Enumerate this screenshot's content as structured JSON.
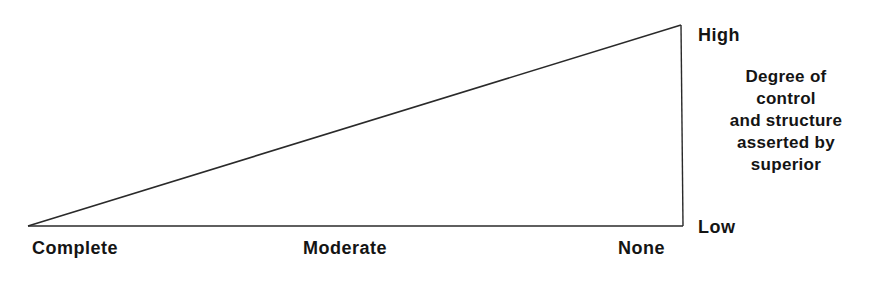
{
  "diagram": {
    "type": "triangle-continuum",
    "x_axis": {
      "labels": [
        "Complete",
        "Moderate",
        "None"
      ]
    },
    "y_axis": {
      "high_label": "High",
      "low_label": "Low",
      "title_lines": [
        "Degree of",
        "control",
        "and structure",
        "asserted by",
        "superior"
      ]
    },
    "line_color": "#2a2a2a"
  }
}
